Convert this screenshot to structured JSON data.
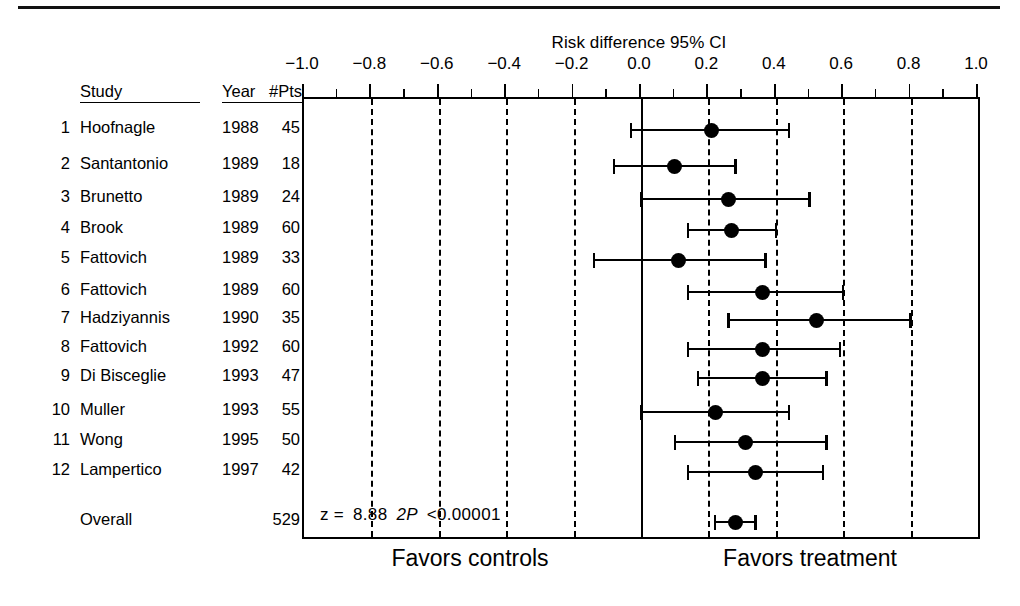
{
  "figure": {
    "title": "Risk difference 95% CI",
    "columns": {
      "study": "Study",
      "year": "Year",
      "pts": "#Pts"
    },
    "footer": {
      "left": "Favors controls",
      "right": "Favors treatment"
    },
    "overall_label": "Overall",
    "overall_pts": "529",
    "stats": {
      "z_label": "z =",
      "z_value": "8.88",
      "p_label": "2P",
      "p_value": "<0.00001"
    }
  },
  "chart_data": {
    "type": "forest",
    "title": "Risk difference 95% CI",
    "xlabel": "Risk difference 95% CI",
    "ylabel": "",
    "xlim": [
      -1.0,
      1.0
    ],
    "grid": true,
    "gridlines": [
      -0.8,
      -0.6,
      -0.4,
      -0.2,
      0.0,
      0.2,
      0.4,
      0.6,
      0.8
    ],
    "zero_line": 0.0,
    "legend": "none",
    "tick_labels": [
      "−1.0",
      "−0.8",
      "−0.6",
      "−0.4",
      "−0.2",
      "0.0",
      "0.2",
      "0.4",
      "0.6",
      "0.8",
      "1.0"
    ],
    "tick_values": [
      -1.0,
      -0.8,
      -0.6,
      -0.4,
      -0.2,
      0.0,
      0.2,
      0.4,
      0.6,
      0.8,
      1.0
    ],
    "minor_tick_values": [
      -0.9,
      -0.7,
      -0.5,
      -0.3,
      -0.1,
      0.1,
      0.3,
      0.5,
      0.7,
      0.9
    ],
    "columns": [
      "#",
      "Study",
      "Year",
      "#Pts",
      "Risk difference",
      "95% CI low",
      "95% CI high"
    ],
    "rows": [
      {
        "num": "1",
        "study": "Hoofnagle",
        "year": "1988",
        "pts": "45",
        "estimate": 0.21,
        "ci_low": -0.03,
        "ci_high": 0.44
      },
      {
        "num": "2",
        "study": "Santantonio",
        "year": "1989",
        "pts": "18",
        "estimate": 0.1,
        "ci_low": -0.08,
        "ci_high": 0.28
      },
      {
        "num": "3",
        "study": "Brunetto",
        "year": "1989",
        "pts": "24",
        "estimate": 0.26,
        "ci_low": 0.0,
        "ci_high": 0.5
      },
      {
        "num": "4",
        "study": "Brook",
        "year": "1989",
        "pts": "60",
        "estimate": 0.27,
        "ci_low": 0.14,
        "ci_high": 0.4
      },
      {
        "num": "5",
        "study": "Fattovich",
        "year": "1989",
        "pts": "33",
        "estimate": 0.11,
        "ci_low": -0.14,
        "ci_high": 0.37
      },
      {
        "num": "6",
        "study": "Fattovich",
        "year": "1989",
        "pts": "60",
        "estimate": 0.36,
        "ci_low": 0.14,
        "ci_high": 0.6
      },
      {
        "num": "7",
        "study": "Hadziyannis",
        "year": "1990",
        "pts": "35",
        "estimate": 0.52,
        "ci_low": 0.26,
        "ci_high": 0.8
      },
      {
        "num": "8",
        "study": "Fattovich",
        "year": "1992",
        "pts": "60",
        "estimate": 0.36,
        "ci_low": 0.14,
        "ci_high": 0.59
      },
      {
        "num": "9",
        "study": "Di Bisceglie",
        "year": "1993",
        "pts": "47",
        "estimate": 0.36,
        "ci_low": 0.17,
        "ci_high": 0.55
      },
      {
        "num": "10",
        "study": "Muller",
        "year": "1993",
        "pts": "55",
        "estimate": 0.22,
        "ci_low": 0.0,
        "ci_high": 0.44
      },
      {
        "num": "11",
        "study": "Wong",
        "year": "1995",
        "pts": "50",
        "estimate": 0.31,
        "ci_low": 0.1,
        "ci_high": 0.55
      },
      {
        "num": "12",
        "study": "Lampertico",
        "year": "1997",
        "pts": "42",
        "estimate": 0.34,
        "ci_low": 0.14,
        "ci_high": 0.54
      }
    ],
    "overall": {
      "study": "Overall",
      "year": "",
      "pts": "529",
      "estimate": 0.28,
      "ci_low": 0.22,
      "ci_high": 0.34
    },
    "annotations": [
      "z = 8.88",
      "2P <0.00001",
      "Favors controls",
      "Favors treatment"
    ]
  }
}
